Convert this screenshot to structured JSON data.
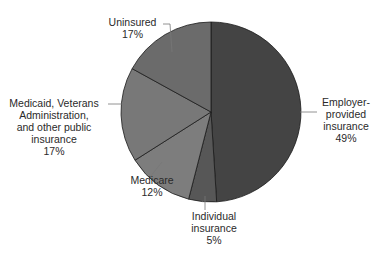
{
  "chart_data": {
    "type": "pie",
    "title": "",
    "start_angle_deg": 0,
    "direction": "clockwise",
    "slices": [
      {
        "name": "Employer-provided insurance",
        "label_lines": [
          "Employer-",
          "provided",
          "insurance"
        ],
        "value": 49,
        "value_label": "49%",
        "color": "#444444"
      },
      {
        "name": "Individual insurance",
        "label_lines": [
          "Individual",
          "insurance"
        ],
        "value": 5,
        "value_label": "5%",
        "color": "#575757"
      },
      {
        "name": "Medicare",
        "label_lines": [
          "Medicare"
        ],
        "value": 12,
        "value_label": "12%",
        "color": "#7d7d7d"
      },
      {
        "name": "Medicaid, Veterans Administration, and other public insurance",
        "label_lines": [
          "Medicaid, Veterans",
          "Administration,",
          "and other public",
          "insurance"
        ],
        "value": 17,
        "value_label": "17%",
        "color": "#787878"
      },
      {
        "name": "Uninsured",
        "label_lines": [
          "Uninsured"
        ],
        "value": 17,
        "value_label": "17%",
        "color": "#6b6b6b"
      }
    ]
  },
  "layout": {
    "cx": 211,
    "cy": 112,
    "r": 90,
    "labels": [
      {
        "x": 318,
        "y": 96,
        "align": "left",
        "leader": [
          [
            300,
            112
          ],
          [
            317,
            112
          ]
        ]
      },
      {
        "x": 187,
        "y": 210,
        "align": "center",
        "leader": [
          [
            205,
            196
          ],
          [
            205,
            210
          ]
        ]
      },
      {
        "x": 125,
        "y": 174,
        "align": "center",
        "leader": [
          [
            162,
            162
          ],
          [
            150,
            177
          ]
        ]
      },
      {
        "x": 2,
        "y": 97,
        "align": "right",
        "leader": [
          [
            108,
            104
          ],
          [
            124,
            104
          ]
        ]
      },
      {
        "x": 104,
        "y": 16,
        "align": "right",
        "leader": [
          [
            163,
            24
          ],
          [
            170,
            24
          ],
          [
            172,
            52
          ]
        ]
      }
    ]
  }
}
